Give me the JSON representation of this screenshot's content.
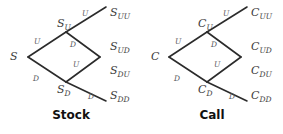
{
  "figure": {
    "background_color": "#ffffff",
    "edge_color": "#2b2b2b",
    "label_color": "#3d3d3d",
    "caption_color": "#111111"
  },
  "trees": [
    {
      "id": "stock",
      "caption": "Stock",
      "root": {
        "base": "S",
        "sub": ""
      },
      "nodes": [
        {
          "key": "root",
          "base": "S",
          "sub": "",
          "x": 16,
          "y": 51
        },
        {
          "key": "up",
          "base": "S",
          "sub": "U",
          "x": 57,
          "y": 18
        },
        {
          "key": "down",
          "base": "S",
          "sub": "D",
          "x": 57,
          "y": 84
        },
        {
          "key": "uu",
          "base": "S",
          "sub": "UU",
          "x": 110,
          "y": 7
        },
        {
          "key": "ud",
          "base": "S",
          "sub": "UD",
          "x": 110,
          "y": 41
        },
        {
          "key": "du",
          "base": "S",
          "sub": "DU",
          "x": 110,
          "y": 65
        },
        {
          "key": "dd",
          "base": "S",
          "sub": "DD",
          "x": 110,
          "y": 90
        }
      ],
      "branches": [
        {
          "key": "root-up",
          "label": "U",
          "x": 34,
          "y": 38
        },
        {
          "key": "root-down",
          "label": "D",
          "x": 33,
          "y": 75
        },
        {
          "key": "up-uu",
          "label": "U",
          "x": 82,
          "y": 10
        },
        {
          "key": "up-ud",
          "label": "D",
          "x": 70,
          "y": 41
        },
        {
          "key": "down-du",
          "label": "U",
          "x": 73,
          "y": 61
        },
        {
          "key": "down-dd",
          "label": "D",
          "x": 88,
          "y": 93
        }
      ]
    },
    {
      "id": "call",
      "caption": "Call",
      "root": {
        "base": "C",
        "sub": ""
      },
      "nodes": [
        {
          "key": "root",
          "base": "C",
          "sub": "",
          "x": 16,
          "y": 51
        },
        {
          "key": "up",
          "base": "C",
          "sub": "U",
          "x": 57,
          "y": 18
        },
        {
          "key": "down",
          "base": "C",
          "sub": "D",
          "x": 57,
          "y": 84
        },
        {
          "key": "uu",
          "base": "C",
          "sub": "UU",
          "x": 110,
          "y": 7
        },
        {
          "key": "ud",
          "base": "C",
          "sub": "UD",
          "x": 110,
          "y": 41
        },
        {
          "key": "du",
          "base": "C",
          "sub": "DU",
          "x": 110,
          "y": 65
        },
        {
          "key": "dd",
          "base": "C",
          "sub": "DD",
          "x": 110,
          "y": 90
        }
      ],
      "branches": [
        {
          "key": "root-up",
          "label": "U",
          "x": 34,
          "y": 38
        },
        {
          "key": "root-down",
          "label": "D",
          "x": 33,
          "y": 75
        },
        {
          "key": "up-uu",
          "label": "U",
          "x": 82,
          "y": 10
        },
        {
          "key": "up-ud",
          "label": "D",
          "x": 70,
          "y": 41
        },
        {
          "key": "down-du",
          "label": "U",
          "x": 73,
          "y": 61
        },
        {
          "key": "down-dd",
          "label": "D",
          "x": 88,
          "y": 93
        }
      ]
    }
  ]
}
